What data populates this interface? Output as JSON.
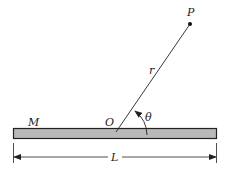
{
  "labels": {
    "point": "P",
    "radius": "r",
    "angle": "θ",
    "mass": "M",
    "origin": "O",
    "length": "L"
  },
  "colors": {
    "rod_fill": "#b9b9b9",
    "stroke": "#222222",
    "background": "#ffffff"
  }
}
